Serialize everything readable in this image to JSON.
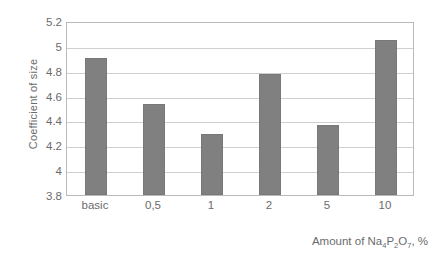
{
  "chart_data": {
    "type": "bar",
    "title": "",
    "xlabel": "Amount of Na4P2O7, %",
    "ylabel": "Coefficient of size",
    "categories": [
      "basic",
      "0,5",
      "1",
      "2",
      "5",
      "10"
    ],
    "values": [
      4.9,
      4.53,
      4.29,
      4.77,
      4.36,
      5.05
    ],
    "ylim": [
      3.8,
      5.2
    ],
    "yticks": [
      "3.8",
      "4",
      "4.2",
      "4.4",
      "4.6",
      "4.8",
      "5",
      "5.2"
    ],
    "ytick_values": [
      3.8,
      4,
      4.2,
      4.4,
      4.6,
      4.8,
      5,
      5.2
    ],
    "grid": true,
    "legend": false,
    "series": [
      {
        "name": "Coefficient of size",
        "values": [
          4.9,
          4.53,
          4.29,
          4.77,
          4.36,
          5.05
        ],
        "color": "#808080"
      }
    ]
  },
  "axis": {
    "y_title": "Coefficient of size",
    "x_title_prefix": "Amount of Na",
    "x_title_sub1": "4",
    "x_title_mid1": "P",
    "x_title_sub2": "2",
    "x_title_mid2": "O",
    "x_title_sub3": "7",
    "x_title_suffix": ", %"
  },
  "colors": {
    "bar": "#808080",
    "bar_border": "#787878",
    "gridline": "#cfcfcf",
    "plot_border": "#b9b9b9",
    "text": "#6b6b6b",
    "background": "#ffffff"
  }
}
